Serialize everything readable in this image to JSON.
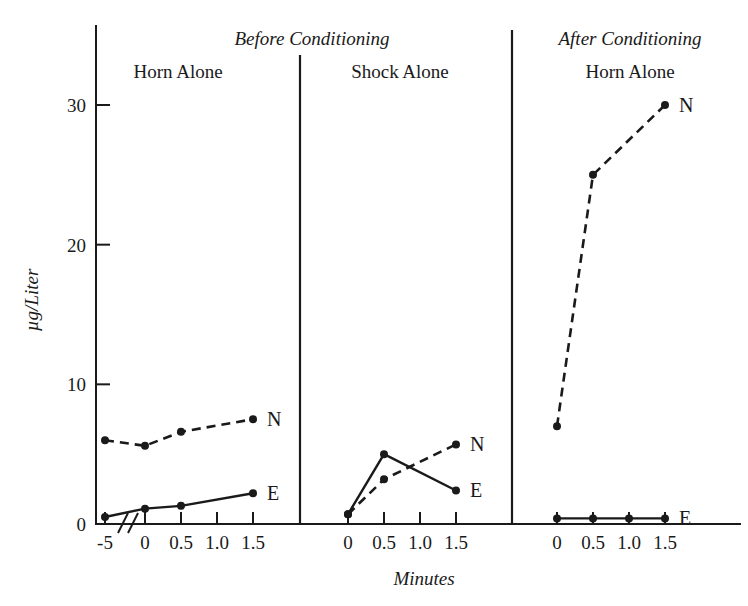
{
  "chart_data": {
    "type": "line",
    "title": "",
    "xlabel": "Minutes",
    "ylabel": "µg/Liter",
    "ylim": [
      0,
      33
    ],
    "yticks": [
      0,
      10,
      20,
      30
    ],
    "ytick_labels": [
      "0",
      "10",
      "20",
      "30"
    ],
    "grid": false,
    "legend": "inline-right-labels",
    "axis_break": true,
    "axis_break_note": "break on x-axis between -5 and 0 in first panel",
    "group_headers": [
      {
        "label": "Before Conditioning",
        "spans_panels": [
          0,
          1
        ]
      },
      {
        "label": "After Conditioning",
        "spans_panels": [
          2
        ]
      }
    ],
    "panels": [
      {
        "title": "Horn Alone",
        "xticks": [
          -5,
          0,
          0.5,
          1.0,
          1.5
        ],
        "xtick_labels": [
          "-5",
          "0",
          "0.5",
          "1.0",
          "1.5"
        ],
        "series": [
          {
            "name": "N",
            "label": "N",
            "style": "dashed",
            "x": [
              -5,
              0,
              0.5,
              1.5
            ],
            "values": [
              6.0,
              5.6,
              6.6,
              7.5
            ]
          },
          {
            "name": "E",
            "label": "E",
            "style": "solid",
            "x": [
              -5,
              0,
              0.5,
              1.5
            ],
            "values": [
              0.5,
              1.1,
              1.3,
              2.2
            ]
          }
        ]
      },
      {
        "title": "Shock Alone",
        "xticks": [
          0,
          0.5,
          1.0,
          1.5
        ],
        "xtick_labels": [
          "0",
          "0.5",
          "1.0",
          "1.5"
        ],
        "series": [
          {
            "name": "N",
            "label": "N",
            "style": "dashed",
            "x": [
              0,
              0.5,
              1.5
            ],
            "values": [
              0.7,
              3.2,
              5.7
            ]
          },
          {
            "name": "E",
            "label": "E",
            "style": "solid",
            "x": [
              0,
              0.5,
              1.5
            ],
            "values": [
              0.7,
              5.0,
              2.4
            ]
          }
        ]
      },
      {
        "title": "Horn Alone",
        "xticks": [
          0,
          0.5,
          1.0,
          1.5
        ],
        "xtick_labels": [
          "0",
          "0.5",
          "1.0",
          "1.5"
        ],
        "series": [
          {
            "name": "N",
            "label": "N",
            "style": "dashed",
            "x": [
              0,
              0.5,
              1.5
            ],
            "values": [
              7.0,
              25.0,
              30.0
            ]
          },
          {
            "name": "E",
            "label": "E",
            "style": "solid",
            "x": [
              0,
              0.5,
              1.0,
              1.5
            ],
            "values": [
              0.4,
              0.4,
              0.4,
              0.4
            ]
          }
        ]
      }
    ],
    "colors": {
      "ink": "#1a1a1a",
      "background": "#ffffff"
    }
  }
}
